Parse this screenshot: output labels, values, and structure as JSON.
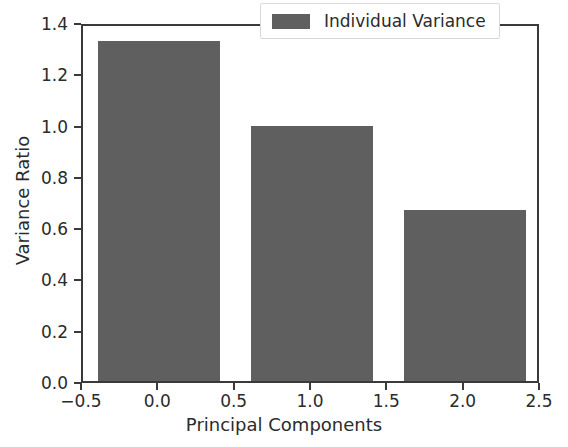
{
  "chart_data": {
    "type": "bar",
    "title": "",
    "xlabel": "Principal Components",
    "ylabel": "Variance Ratio",
    "categories": [
      "0",
      "1",
      "2"
    ],
    "x": [
      0,
      1,
      2
    ],
    "values": [
      1.325,
      0.995,
      0.665
    ],
    "bar_width": 0.8,
    "series": [
      {
        "name": "Individual Variance",
        "values": [
          1.325,
          0.995,
          0.665
        ],
        "color": "#5f5f5f"
      }
    ],
    "xlim": [
      -0.5,
      2.5
    ],
    "ylim": [
      0.0,
      1.4
    ],
    "xticks": [
      -0.5,
      0.0,
      0.5,
      1.0,
      1.5,
      2.0,
      2.5
    ],
    "xticklabels": [
      "−0.5",
      "0.0",
      "0.5",
      "1.0",
      "1.5",
      "2.0",
      "2.5"
    ],
    "yticks": [
      0.0,
      0.2,
      0.4,
      0.6,
      0.8,
      1.0,
      1.2,
      1.4
    ],
    "yticklabels": [
      "0.0",
      "0.2",
      "0.4",
      "0.6",
      "0.8",
      "1.0",
      "1.2",
      "1.4"
    ],
    "grid": false,
    "legend": {
      "position": "upper right",
      "entries": [
        {
          "label": "Individual Variance",
          "color": "#5f5f5f"
        }
      ]
    },
    "background_color": "#ffffff",
    "axis_color": "#3a3a3a"
  }
}
